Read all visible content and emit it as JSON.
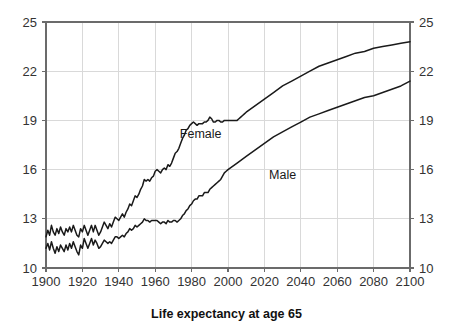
{
  "chart_data": {
    "type": "line",
    "title": "Life expectancy at age 65",
    "xlabel": "",
    "ylabel": "",
    "xlim": [
      1900,
      2100
    ],
    "ylim": [
      10,
      25
    ],
    "xticks": [
      1900,
      1920,
      1940,
      1960,
      1980,
      2000,
      2020,
      2040,
      2060,
      2080,
      2100
    ],
    "yticks": [
      10,
      13,
      16,
      19,
      22,
      25
    ],
    "grid": true,
    "legend": "inline-annotations",
    "right_axis_mirrored": true,
    "line_color": "#1a1a1a",
    "grid_color": "#d9d9d9",
    "frame_color": "#6b6b6b",
    "annotations": [
      {
        "text": "Female",
        "x": 1985,
        "y": 17.9
      },
      {
        "text": "Male",
        "x": 2030,
        "y": 15.4
      }
    ],
    "series": [
      {
        "name": "Female",
        "x": [
          1900,
          1901,
          1902,
          1903,
          1904,
          1905,
          1906,
          1907,
          1908,
          1909,
          1910,
          1911,
          1912,
          1913,
          1914,
          1915,
          1916,
          1917,
          1918,
          1919,
          1920,
          1921,
          1922,
          1923,
          1924,
          1925,
          1926,
          1927,
          1928,
          1929,
          1930,
          1931,
          1932,
          1933,
          1934,
          1935,
          1936,
          1937,
          1938,
          1939,
          1940,
          1941,
          1942,
          1943,
          1944,
          1945,
          1946,
          1947,
          1948,
          1949,
          1950,
          1951,
          1952,
          1953,
          1954,
          1955,
          1956,
          1957,
          1958,
          1959,
          1960,
          1961,
          1962,
          1963,
          1964,
          1965,
          1966,
          1967,
          1968,
          1969,
          1970,
          1971,
          1972,
          1973,
          1974,
          1975,
          1976,
          1977,
          1978,
          1979,
          1980,
          1981,
          1982,
          1983,
          1984,
          1985,
          1986,
          1987,
          1988,
          1989,
          1990,
          1991,
          1992,
          1993,
          1994,
          1995,
          1996,
          1997,
          1998,
          1999,
          2000,
          2001,
          2002,
          2003,
          2004,
          2005,
          2006,
          2007,
          2008,
          2009,
          2010,
          2015,
          2020,
          2025,
          2030,
          2035,
          2040,
          2045,
          2050,
          2055,
          2060,
          2065,
          2070,
          2075,
          2080,
          2085,
          2090,
          2095,
          2100
        ],
        "y": [
          11.9,
          12.3,
          12.0,
          12.6,
          12.2,
          12.0,
          12.4,
          12.1,
          12.5,
          12.2,
          12.0,
          12.4,
          12.2,
          12.5,
          12.2,
          12.6,
          12.3,
          12.0,
          11.9,
          12.4,
          12.2,
          12.6,
          12.3,
          12.0,
          12.3,
          12.6,
          12.2,
          12.6,
          12.3,
          12.0,
          12.2,
          12.5,
          12.8,
          12.6,
          12.4,
          12.7,
          12.5,
          12.8,
          13.1,
          13.0,
          12.9,
          13.1,
          13.3,
          13.1,
          13.4,
          13.6,
          13.9,
          13.8,
          14.1,
          14.4,
          14.3,
          14.5,
          14.8,
          15.0,
          15.4,
          15.3,
          15.4,
          15.3,
          15.5,
          15.6,
          15.9,
          16.0,
          15.9,
          15.8,
          16.0,
          16.1,
          16.0,
          16.3,
          16.2,
          16.4,
          16.7,
          17.0,
          17.1,
          17.3,
          17.6,
          17.9,
          18.1,
          18.4,
          18.5,
          18.7,
          18.8,
          18.9,
          18.8,
          18.7,
          18.8,
          18.8,
          18.8,
          18.9,
          18.9,
          19.0,
          19.2,
          19.1,
          18.9,
          18.9,
          19.0,
          19.0,
          18.9,
          18.9,
          19.0,
          19.0,
          19.0,
          19.0,
          19.0,
          19.0,
          19.0,
          19.0,
          19.1,
          19.2,
          19.3,
          19.4,
          19.5,
          19.9,
          20.3,
          20.7,
          21.1,
          21.4,
          21.7,
          22.0,
          22.3,
          22.5,
          22.7,
          22.9,
          23.1,
          23.2,
          23.4,
          23.5,
          23.6,
          23.7,
          23.8
        ]
      },
      {
        "name": "Male",
        "x": [
          1900,
          1901,
          1902,
          1903,
          1904,
          1905,
          1906,
          1907,
          1908,
          1909,
          1910,
          1911,
          1912,
          1913,
          1914,
          1915,
          1916,
          1917,
          1918,
          1919,
          1920,
          1921,
          1922,
          1923,
          1924,
          1925,
          1926,
          1927,
          1928,
          1929,
          1930,
          1931,
          1932,
          1933,
          1934,
          1935,
          1936,
          1937,
          1938,
          1939,
          1940,
          1941,
          1942,
          1943,
          1944,
          1945,
          1946,
          1947,
          1948,
          1949,
          1950,
          1951,
          1952,
          1953,
          1954,
          1955,
          1956,
          1957,
          1958,
          1959,
          1960,
          1961,
          1962,
          1963,
          1964,
          1965,
          1966,
          1967,
          1968,
          1969,
          1970,
          1971,
          1972,
          1973,
          1974,
          1975,
          1976,
          1977,
          1978,
          1979,
          1980,
          1981,
          1982,
          1983,
          1984,
          1985,
          1986,
          1987,
          1988,
          1989,
          1990,
          1991,
          1992,
          1993,
          1994,
          1995,
          1996,
          1997,
          1998,
          1999,
          2000,
          2005,
          2010,
          2015,
          2020,
          2025,
          2030,
          2035,
          2040,
          2045,
          2050,
          2055,
          2060,
          2065,
          2070,
          2075,
          2080,
          2085,
          2090,
          2095,
          2100
        ],
        "y": [
          11.2,
          11.5,
          11.1,
          11.6,
          11.2,
          10.9,
          11.3,
          11.0,
          11.4,
          11.2,
          11.0,
          11.4,
          11.1,
          11.5,
          11.2,
          11.6,
          11.3,
          11.0,
          10.8,
          11.4,
          11.2,
          11.8,
          11.5,
          11.2,
          11.5,
          11.8,
          11.4,
          11.7,
          11.5,
          11.2,
          11.3,
          11.5,
          11.7,
          11.6,
          11.5,
          11.6,
          11.5,
          11.7,
          11.9,
          11.9,
          11.8,
          11.9,
          12.0,
          11.9,
          12.1,
          12.2,
          12.4,
          12.3,
          12.4,
          12.6,
          12.5,
          12.6,
          12.7,
          12.8,
          13.0,
          12.9,
          12.9,
          12.8,
          12.9,
          12.9,
          12.9,
          12.9,
          12.8,
          12.7,
          12.8,
          12.8,
          12.7,
          12.9,
          12.8,
          12.8,
          12.9,
          12.9,
          12.8,
          12.9,
          13.0,
          13.2,
          13.3,
          13.5,
          13.6,
          13.8,
          13.9,
          14.1,
          14.2,
          14.2,
          14.4,
          14.4,
          14.4,
          14.6,
          14.6,
          14.6,
          14.8,
          14.9,
          15.0,
          15.1,
          15.2,
          15.3,
          15.4,
          15.6,
          15.8,
          15.9,
          16.0,
          16.4,
          16.8,
          17.2,
          17.6,
          18.0,
          18.3,
          18.6,
          18.9,
          19.2,
          19.4,
          19.6,
          19.8,
          20.0,
          20.2,
          20.4,
          20.5,
          20.7,
          20.9,
          21.1,
          21.4
        ]
      }
    ]
  }
}
